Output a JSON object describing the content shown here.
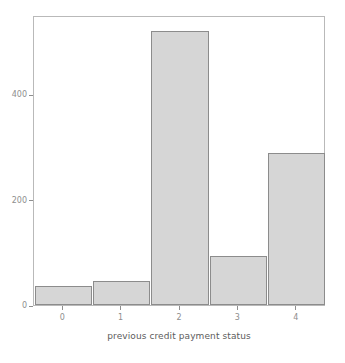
{
  "chart_data": {
    "type": "bar",
    "title": "",
    "xlabel": "previous credit payment status",
    "ylabel": "",
    "categories": [
      "0",
      "1",
      "2",
      "3",
      "4"
    ],
    "values": [
      36,
      45,
      520,
      93,
      288
    ],
    "xticks": [
      "0",
      "1",
      "2",
      "3",
      "4"
    ],
    "yticks": [
      "0",
      "200",
      "400"
    ],
    "ytick_values": [
      0,
      200,
      400
    ],
    "ylim": [
      0,
      550
    ],
    "xlim": [
      -0.5,
      4.5
    ],
    "grid": false,
    "legend": null,
    "bar_fill_color": "#d6d6d6",
    "bar_edge_color": "#8c8c8c",
    "axes_frame_color": "#b9b9b9",
    "tick_label_color": "#8e8e8e",
    "axis_label_color": "#5c5c5c",
    "background_color": "#ffffff"
  }
}
